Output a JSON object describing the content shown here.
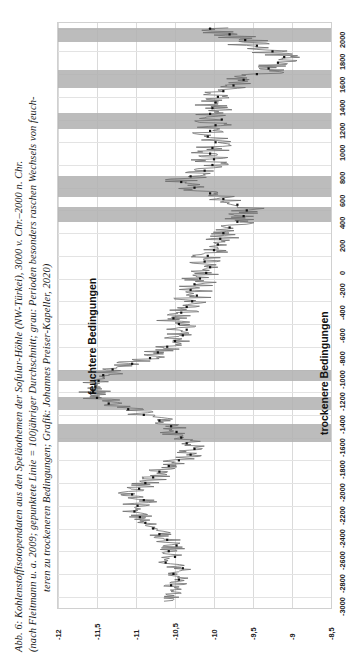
{
  "figure": {
    "caption_lines": [
      "Abb. 6: Kohlenstoffisotopendaten aus den Speläothemen der Sofular-Höhle (NW-Türkei), 3000 v. Chr.–2000 n. Chr.",
      "(nach Fleitmann u. a. 2009; gepunktete Linie = 100jähriger Durchschnitt; grau: Perioden besonders raschen Wechsels von feuch-",
      "teren zu trockeneren Bedingungen; Grafik: Johannes Preiser-Kapeller, 2020)"
    ]
  },
  "annotations": {
    "wetter": "feuchtere Bedingungen",
    "drier": "trockenere Bedingungen"
  },
  "colors": {
    "raw_line": "#6f6f6f",
    "mean_dots": "#101010",
    "band": "#b0b0b0",
    "grid": "#dcdcdc",
    "plot_border": "#d0d0d0"
  },
  "chart_data": {
    "type": "line",
    "orientation": "rotated-90-ccw",
    "xlabel": "",
    "ylabel": "",
    "axes": {
      "value_axis": {
        "name": "d13C (‰)",
        "ticks": [
          "-12",
          "-11,5",
          "-11",
          "-10,5",
          "-10",
          "-9,5",
          "-9",
          "-8,5"
        ],
        "tick_values": [
          -12,
          -11.5,
          -11,
          -10.5,
          -10,
          -9.5,
          -9,
          -8.5
        ],
        "limits": [
          -12,
          -8.5
        ],
        "direction": "left_to_right_in_plot"
      },
      "time_axis": {
        "name": "Jahr (v./n. Chr.)",
        "ticks": [
          "-3000",
          "-2800",
          "-2600",
          "-2400",
          "-2200",
          "-2000",
          "-1800",
          "-1600",
          "-1400",
          "-1200",
          "-1000",
          "-800",
          "-600",
          "-400",
          "-200",
          "0",
          "200",
          "400",
          "600",
          "800",
          "1000",
          "1200",
          "1400",
          "1600",
          "1800",
          "2000"
        ],
        "tick_values": [
          -3000,
          -2800,
          -2600,
          -2400,
          -2200,
          -2000,
          -1800,
          -1600,
          -1400,
          -1200,
          -1000,
          -800,
          -600,
          -400,
          -200,
          0,
          200,
          400,
          600,
          800,
          1000,
          1200,
          1400,
          1600,
          1800,
          2000
        ],
        "limits": [
          -3100,
          2050
        ],
        "direction": "bottom_to_top_in_plot"
      }
    },
    "legend": [
      {
        "name": "Rohdaten (Einzelmessungen)",
        "style": "thin grey line"
      },
      {
        "name": "100jähriger Durchschnitt",
        "style": "black dotted line"
      },
      {
        "name": "Perioden raschen Wechsels feucht→trocken",
        "style": "grey horizontal band"
      }
    ],
    "grid": true,
    "bands_time_ranges": [
      [
        1880,
        2010
      ],
      [
        1480,
        1640
      ],
      [
        1120,
        1260
      ],
      [
        520,
        700
      ],
      [
        300,
        430
      ],
      [
        -1000,
        -1100
      ],
      [
        -1240,
        -1360
      ],
      [
        -1480,
        -1640
      ]
    ],
    "series": [
      {
        "name": "100jähriger Durchschnitt",
        "style": "dotted",
        "points": [
          {
            "year": -2900,
            "d13C": -10.55
          },
          {
            "year": -2850,
            "d13C": -10.45
          },
          {
            "year": -2800,
            "d13C": -10.52
          },
          {
            "year": -2750,
            "d13C": -10.4
          },
          {
            "year": -2700,
            "d13C": -10.62
          },
          {
            "year": -2650,
            "d13C": -10.5
          },
          {
            "year": -2600,
            "d13C": -10.58
          },
          {
            "year": -2550,
            "d13C": -10.48
          },
          {
            "year": -2500,
            "d13C": -10.6
          },
          {
            "year": -2450,
            "d13C": -10.7
          },
          {
            "year": -2400,
            "d13C": -10.78
          },
          {
            "year": -2350,
            "d13C": -10.88
          },
          {
            "year": -2300,
            "d13C": -10.95
          },
          {
            "year": -2250,
            "d13C": -11.02
          },
          {
            "year": -2200,
            "d13C": -10.98
          },
          {
            "year": -2150,
            "d13C": -10.9
          },
          {
            "year": -2100,
            "d13C": -11.05
          },
          {
            "year": -2050,
            "d13C": -10.96
          },
          {
            "year": -2000,
            "d13C": -10.88
          },
          {
            "year": -1950,
            "d13C": -10.78
          },
          {
            "year": -1900,
            "d13C": -10.7
          },
          {
            "year": -1850,
            "d13C": -10.58
          },
          {
            "year": -1800,
            "d13C": -10.45
          },
          {
            "year": -1750,
            "d13C": -10.3
          },
          {
            "year": -1700,
            "d13C": -10.25
          },
          {
            "year": -1650,
            "d13C": -10.35
          },
          {
            "year": -1600,
            "d13C": -10.42
          },
          {
            "year": -1550,
            "d13C": -10.48
          },
          {
            "year": -1500,
            "d13C": -10.55
          },
          {
            "year": -1450,
            "d13C": -10.7
          },
          {
            "year": -1400,
            "d13C": -10.9
          },
          {
            "year": -1350,
            "d13C": -11.1
          },
          {
            "year": -1300,
            "d13C": -11.35
          },
          {
            "year": -1250,
            "d13C": -11.5
          },
          {
            "year": -1200,
            "d13C": -11.55
          },
          {
            "year": -1150,
            "d13C": -11.52
          },
          {
            "year": -1100,
            "d13C": -11.48
          },
          {
            "year": -1050,
            "d13C": -11.42
          },
          {
            "year": -1000,
            "d13C": -11.3
          },
          {
            "year": -950,
            "d13C": -11.05
          },
          {
            "year": -900,
            "d13C": -10.82
          },
          {
            "year": -850,
            "d13C": -10.72
          },
          {
            "year": -800,
            "d13C": -10.6
          },
          {
            "year": -750,
            "d13C": -10.5
          },
          {
            "year": -700,
            "d13C": -10.4
          },
          {
            "year": -650,
            "d13C": -10.35
          },
          {
            "year": -600,
            "d13C": -10.45
          },
          {
            "year": -550,
            "d13C": -10.52
          },
          {
            "year": -500,
            "d13C": -10.42
          },
          {
            "year": -450,
            "d13C": -10.35
          },
          {
            "year": -400,
            "d13C": -10.28
          },
          {
            "year": -350,
            "d13C": -10.22
          },
          {
            "year": -300,
            "d13C": -10.3
          },
          {
            "year": -250,
            "d13C": -10.25
          },
          {
            "year": -200,
            "d13C": -10.18
          },
          {
            "year": -150,
            "d13C": -10.1
          },
          {
            "year": -100,
            "d13C": -10.05
          },
          {
            "year": -50,
            "d13C": -10.12
          },
          {
            "year": 0,
            "d13C": -10.08
          },
          {
            "year": 50,
            "d13C": -10.0
          },
          {
            "year": 100,
            "d13C": -9.95
          },
          {
            "year": 150,
            "d13C": -9.92
          },
          {
            "year": 200,
            "d13C": -9.88
          },
          {
            "year": 250,
            "d13C": -9.8
          },
          {
            "year": 300,
            "d13C": -9.7
          },
          {
            "year": 350,
            "d13C": -9.62
          },
          {
            "year": 400,
            "d13C": -9.58
          },
          {
            "year": 450,
            "d13C": -9.7
          },
          {
            "year": 500,
            "d13C": -9.88
          },
          {
            "year": 550,
            "d13C": -10.05
          },
          {
            "year": 600,
            "d13C": -10.25
          },
          {
            "year": 650,
            "d13C": -10.42
          },
          {
            "year": 700,
            "d13C": -10.3
          },
          {
            "year": 750,
            "d13C": -10.12
          },
          {
            "year": 800,
            "d13C": -10.02
          },
          {
            "year": 850,
            "d13C": -10.0
          },
          {
            "year": 900,
            "d13C": -10.05
          },
          {
            "year": 950,
            "d13C": -10.02
          },
          {
            "year": 1000,
            "d13C": -9.98
          },
          {
            "year": 1050,
            "d13C": -10.08
          },
          {
            "year": 1100,
            "d13C": -10.05
          },
          {
            "year": 1150,
            "d13C": -9.98
          },
          {
            "year": 1200,
            "d13C": -9.9
          },
          {
            "year": 1250,
            "d13C": -10.05
          },
          {
            "year": 1300,
            "d13C": -10.02
          },
          {
            "year": 1350,
            "d13C": -9.98
          },
          {
            "year": 1400,
            "d13C": -9.95
          },
          {
            "year": 1450,
            "d13C": -9.88
          },
          {
            "year": 1500,
            "d13C": -9.75
          },
          {
            "year": 1550,
            "d13C": -9.62
          },
          {
            "year": 1600,
            "d13C": -9.45
          },
          {
            "year": 1650,
            "d13C": -9.3
          },
          {
            "year": 1700,
            "d13C": -9.18
          },
          {
            "year": 1750,
            "d13C": -9.1
          },
          {
            "year": 1800,
            "d13C": -9.25
          },
          {
            "year": 1850,
            "d13C": -9.45
          },
          {
            "year": 1900,
            "d13C": -9.6
          },
          {
            "year": 1950,
            "d13C": -9.8
          },
          {
            "year": 2000,
            "d13C": -10.05
          }
        ]
      }
    ]
  }
}
